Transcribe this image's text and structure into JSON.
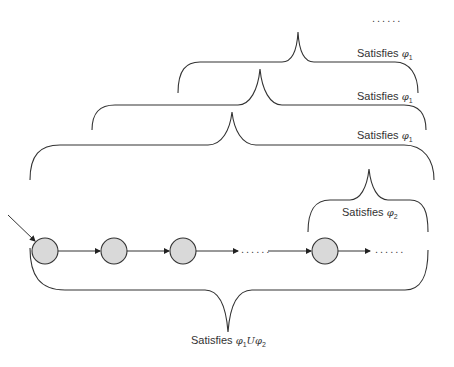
{
  "diagram": {
    "title": "",
    "top_ellipsis": "......",
    "braces": [
      {
        "id": "phi1-level-3",
        "label_prefix": "Satisfies",
        "symbol": "φ",
        "subscript": "1"
      },
      {
        "id": "phi1-level-2",
        "label_prefix": "Satisfies",
        "symbol": "φ",
        "subscript": "1"
      },
      {
        "id": "phi1-level-1",
        "label_prefix": "Satisfies",
        "symbol": "φ",
        "subscript": "1"
      },
      {
        "id": "phi2",
        "label_prefix": "Satisfies",
        "symbol": "φ",
        "subscript": "2"
      }
    ],
    "bottom_brace": {
      "label_prefix": "Satisfies",
      "symbol_a": "φ",
      "subscript_a": "1",
      "operator": "U",
      "symbol_b": "φ",
      "subscript_b": "2"
    },
    "path": {
      "states": [
        {
          "id": "s0",
          "initial": true
        },
        {
          "id": "s1"
        },
        {
          "id": "s2"
        },
        {
          "id": "sk"
        }
      ],
      "ellipsis_middle": "......",
      "ellipsis_end": "......"
    },
    "colors": {
      "node_fill": "#d9d9d9",
      "stroke": "#333333",
      "text": "#333333"
    }
  }
}
